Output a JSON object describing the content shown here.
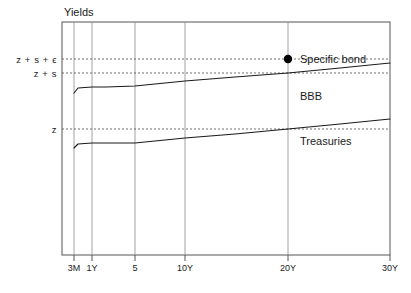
{
  "chart_data": {
    "type": "line",
    "title": "",
    "xlabel": "",
    "ylabel": "Yields",
    "grid": true,
    "legend_position": "inline-right",
    "x_tick_labels": [
      "3M",
      "1Y",
      "5",
      "10Y",
      "20Y",
      "30Y"
    ],
    "x_tick_positions": [
      74,
      92,
      135,
      185,
      288,
      390
    ],
    "y_tick_labels": [
      "z + s + ϵ",
      "z + s",
      "z"
    ],
    "y_tick_positions": [
      59,
      73,
      129
    ],
    "plot_area": {
      "left": 62,
      "top": 22,
      "right": 390,
      "bottom": 255
    },
    "series": [
      {
        "name": "BBB",
        "label": "BBB",
        "color": "#1a1a1a",
        "points": [
          [
            74,
            93
          ],
          [
            78,
            88
          ],
          [
            92,
            87
          ],
          [
            106,
            87
          ],
          [
            135,
            86
          ],
          [
            185,
            81
          ],
          [
            235,
            77
          ],
          [
            288,
            73
          ],
          [
            340,
            68
          ],
          [
            390,
            63
          ]
        ],
        "label_position": [
          300,
          97
        ]
      },
      {
        "name": "Treasuries",
        "label": "Treasuries",
        "color": "#1a1a1a",
        "points": [
          [
            74,
            148
          ],
          [
            78,
            144
          ],
          [
            92,
            143
          ],
          [
            106,
            143
          ],
          [
            135,
            143
          ],
          [
            185,
            138
          ],
          [
            235,
            134
          ],
          [
            288,
            129
          ],
          [
            340,
            124
          ],
          [
            390,
            119
          ]
        ],
        "label_position": [
          300,
          142
        ]
      }
    ],
    "annotations": [
      {
        "name": "specific-bond",
        "label": "Specific  bond",
        "marker": "filled-circle",
        "marker_color": "#000000",
        "x": 288,
        "y": 59,
        "x_tick": "20Y",
        "y_tick": "z + s + ϵ",
        "label_position": [
          300,
          59
        ]
      }
    ]
  }
}
